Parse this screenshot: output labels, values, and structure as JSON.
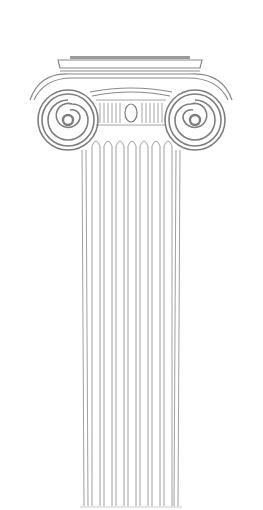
{
  "image": {
    "subject": "Ionic column line drawing",
    "background": "#ffffff",
    "stroke_color": "#8a8a8a",
    "dark_stroke_color": "#6e6e6e",
    "flute_count": 8
  }
}
